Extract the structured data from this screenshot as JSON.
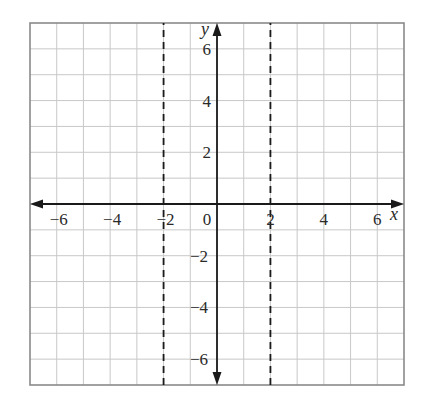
{
  "chart_data": {
    "type": "line",
    "title": "",
    "xlabel": "x",
    "ylabel": "y",
    "xlim": [
      -7,
      7
    ],
    "ylim": [
      -7,
      7
    ],
    "grid": true,
    "grid_step": 1,
    "x_tick_labels": [
      {
        "value": -6,
        "label": "−6"
      },
      {
        "value": -4,
        "label": "−4"
      },
      {
        "value": -2,
        "label": "−2"
      },
      {
        "value": 0,
        "label": "0"
      },
      {
        "value": 2,
        "label": "2"
      },
      {
        "value": 4,
        "label": "4"
      },
      {
        "value": 6,
        "label": "6"
      }
    ],
    "y_tick_labels": [
      {
        "value": 6,
        "label": "6"
      },
      {
        "value": 4,
        "label": "4"
      },
      {
        "value": 2,
        "label": "2"
      },
      {
        "value": -2,
        "label": "−2"
      },
      {
        "value": -4,
        "label": "−4"
      },
      {
        "value": -6,
        "label": "−6"
      }
    ],
    "series": [
      {
        "name": "vertical asymptote x = -2",
        "style": "dashed",
        "x": [
          -2,
          -2
        ],
        "y": [
          -7,
          7
        ]
      },
      {
        "name": "vertical asymptote x = 2",
        "style": "dashed",
        "x": [
          2,
          2
        ],
        "y": [
          -7,
          7
        ]
      }
    ],
    "legend": null
  },
  "colors": {
    "grid": "#c8c8c8",
    "border": "#8a8a8a",
    "axis": "#1a1a1a",
    "dashed": "#1a1a1a",
    "text": "#2a2a2a"
  }
}
